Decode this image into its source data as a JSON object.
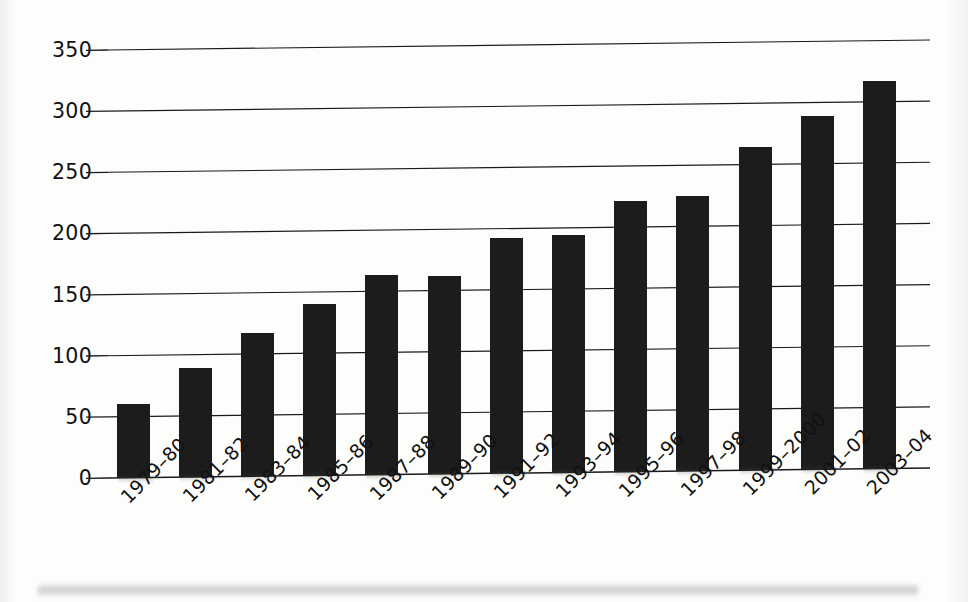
{
  "chart_data": {
    "type": "bar",
    "title": "",
    "subtitle": "",
    "xlabel": "",
    "ylabel": "",
    "categories": [
      "1979–80",
      "1981–82",
      "1983–84",
      "1985–86",
      "1987–88",
      "1989–90",
      "1991–92",
      "1993–94",
      "1995–96",
      "1997–98",
      "1999–2000",
      "2001–02",
      "2003–04"
    ],
    "values": [
      60,
      89,
      117,
      140,
      163,
      162,
      192,
      194,
      221,
      225,
      264,
      289,
      317
    ],
    "ylim": [
      0,
      350
    ],
    "ytick_values": [
      0,
      50,
      100,
      150,
      200,
      250,
      300,
      350
    ],
    "ytick_labels": [
      "0",
      "50",
      "100",
      "150",
      "200",
      "250",
      "300",
      "350"
    ],
    "grid": true,
    "grid_axis": "y",
    "legend": null,
    "legend_position": "none",
    "bar_color": "#1c1c1c",
    "annotations": []
  },
  "style": {
    "background": "#fdfdfc",
    "axis_color": "#1a1a1a",
    "text_color": "#111111"
  }
}
